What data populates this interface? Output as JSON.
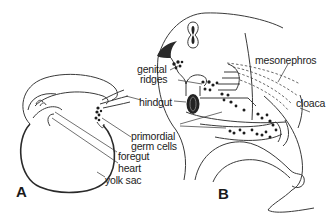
{
  "figure": {
    "panels": [
      {
        "id": "A",
        "label": "A"
      },
      {
        "id": "B",
        "label": "B"
      }
    ],
    "labels": {
      "genital_ridges_line1": "genital",
      "genital_ridges_line2": "ridges",
      "hindgut": "hindgut",
      "primordial_line1": "primordial",
      "primordial_line2": "germ cells",
      "foregut": "foregut",
      "heart": "heart",
      "yolk_sac": "yolk sac",
      "mesonephros": "mesonephros",
      "cloaca": "cloaca"
    },
    "colors": {
      "line": "#3a3a3a",
      "germ_cells": "#1c1c1c",
      "background": "#ffffff"
    }
  }
}
